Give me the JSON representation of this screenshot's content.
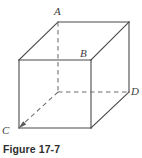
{
  "figure": {
    "caption": "Figure 17-7",
    "type": "line-drawing",
    "stroke_color": "#4a4a4a",
    "hidden_stroke_color": "#6e6e6e",
    "background_color": "#ffffff",
    "canvas": {
      "width": 142,
      "height": 158
    }
  },
  "labels": {
    "a": "A",
    "b": "B",
    "c": "C",
    "d": "D"
  },
  "vertices": {
    "front_top_left": [
      19,
      60
    ],
    "front_top_right": [
      91,
      60
    ],
    "front_bottom_right": [
      91,
      128
    ],
    "front_bottom_left": [
      19,
      128
    ],
    "back_top_left": [
      58,
      22
    ],
    "back_top_right": [
      129,
      22
    ],
    "back_bottom_right": [
      129,
      92
    ],
    "back_bottom_left": [
      58,
      92
    ]
  },
  "edges": {
    "solid": [
      [
        "front_top_left",
        "front_top_right"
      ],
      [
        "front_top_right",
        "front_bottom_right"
      ],
      [
        "front_bottom_right",
        "front_bottom_left"
      ],
      [
        "front_bottom_left",
        "front_top_left"
      ],
      [
        "back_top_left",
        "back_top_right"
      ],
      [
        "back_top_right",
        "back_bottom_right"
      ],
      [
        "front_top_left",
        "back_top_left"
      ],
      [
        "front_top_right",
        "back_top_right"
      ],
      [
        "front_bottom_right",
        "back_bottom_right"
      ]
    ],
    "dashed": [
      [
        "back_top_left",
        "back_bottom_left"
      ],
      [
        "back_bottom_left",
        "back_bottom_right"
      ],
      [
        "back_bottom_left",
        "front_bottom_left"
      ]
    ]
  },
  "annotations": {
    "c_arrow": {
      "from": [
        40,
        112
      ],
      "to": [
        19,
        128
      ],
      "style": "dashed-with-arrowhead",
      "points_to": "front_bottom_left"
    }
  }
}
